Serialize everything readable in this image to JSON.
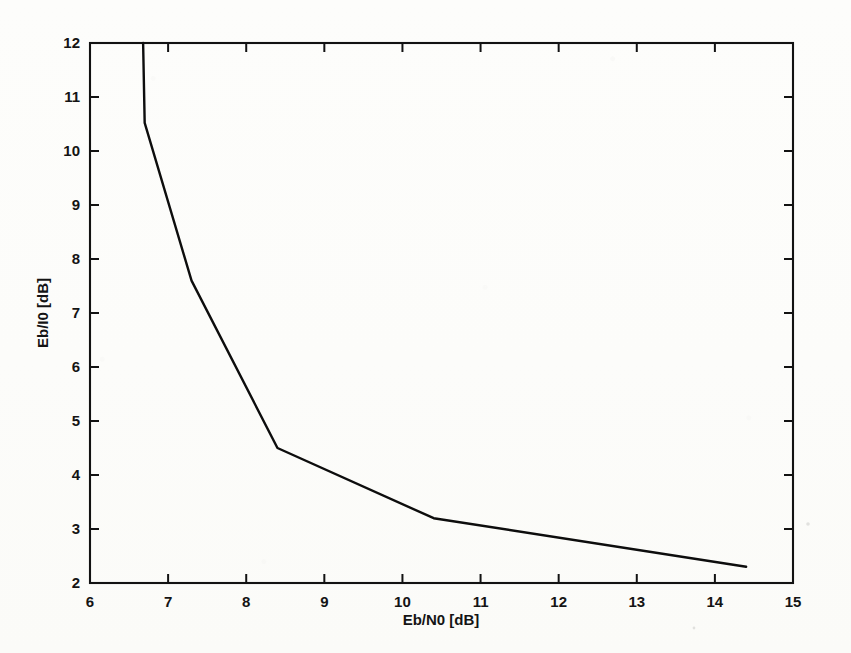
{
  "figure": {
    "title": "",
    "background_color": "#fdfdfb",
    "line_color": "#0d0d0d",
    "axis_color": "#121212"
  },
  "axes": {
    "x_title": "Eb/N0 [dB]",
    "y_title": "Eb/I0 [dB]",
    "x_ticks": [
      "6",
      "7",
      "8",
      "9",
      "10",
      "11",
      "12",
      "13",
      "14",
      "15"
    ],
    "y_ticks": [
      "2",
      "3",
      "4",
      "5",
      "6",
      "7",
      "8",
      "9",
      "10",
      "11",
      "12"
    ]
  },
  "chart_data": {
    "type": "line",
    "title": "",
    "xlabel": "Eb/N0 [dB]",
    "ylabel": "Eb/I0 [dB]",
    "xlim": [
      6,
      15
    ],
    "ylim": [
      2,
      12
    ],
    "xticks": [
      6,
      7,
      8,
      9,
      10,
      11,
      12,
      13,
      14,
      15
    ],
    "yticks": [
      2,
      3,
      4,
      5,
      6,
      7,
      8,
      9,
      10,
      11,
      12
    ],
    "grid": false,
    "legend": null,
    "box": true,
    "series": [
      {
        "name": "Eb/I0 vs Eb/N0",
        "x": [
          6.68,
          6.7,
          7.3,
          8.4,
          10.4,
          14.4
        ],
        "y": [
          12.0,
          10.52,
          7.6,
          4.5,
          3.2,
          2.3
        ]
      }
    ]
  }
}
